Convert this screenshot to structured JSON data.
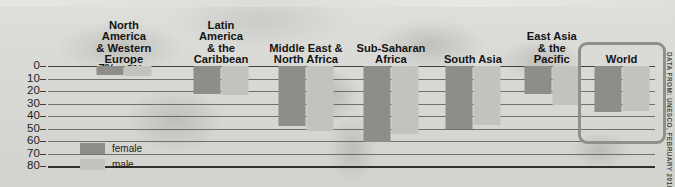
{
  "chart_data": {
    "type": "bar",
    "title": "",
    "xlabel": "",
    "ylabel": "",
    "ylim": [
      0,
      80
    ],
    "yticks": [
      0,
      10,
      20,
      30,
      40,
      50,
      60,
      70,
      80
    ],
    "grid": true,
    "legend_position": "inside-bottom-left",
    "categories": [
      "North\nAmerica\n& Western\nEurope",
      "Latin\nAmerica\n& the\nCaribbean",
      "Middle East &\nNorth Africa",
      "Sub-Saharan\nAfrica",
      "South Asia",
      "East Asia\n& the\nPacific",
      "World"
    ],
    "series": [
      {
        "name": "female",
        "values": [
          7,
          22,
          48,
          61,
          50,
          22,
          37
        ],
        "color": "#8d8d8a"
      },
      {
        "name": "male",
        "values": [
          8,
          23,
          52,
          54,
          47,
          31,
          36
        ],
        "color": "#c2c2bf"
      }
    ],
    "data_labels": [
      [
        "7%",
        "22%",
        "48%",
        "61%",
        "50%",
        "22%",
        "37%"
      ],
      [
        "8%",
        "23%",
        "52%",
        "54%",
        "47%",
        "31%",
        "36%"
      ]
    ],
    "highlighted_category": "World",
    "annotations": [
      "DATA FROM: UNESCO, FEBRUARY 2018"
    ]
  },
  "legend": {
    "items": [
      {
        "label": "female",
        "color": "#8d8d8a"
      },
      {
        "label": "male",
        "color": "#c2c2bf"
      }
    ]
  },
  "source_note": "DATA FROM: UNESCO, FEBRUARY 2018",
  "colors": {
    "female": "#8d8d8a",
    "male": "#c2c2bf",
    "background": "#d9d9d6",
    "axis": "#3a3a3a",
    "highlight_border": "#8f8f8c"
  }
}
